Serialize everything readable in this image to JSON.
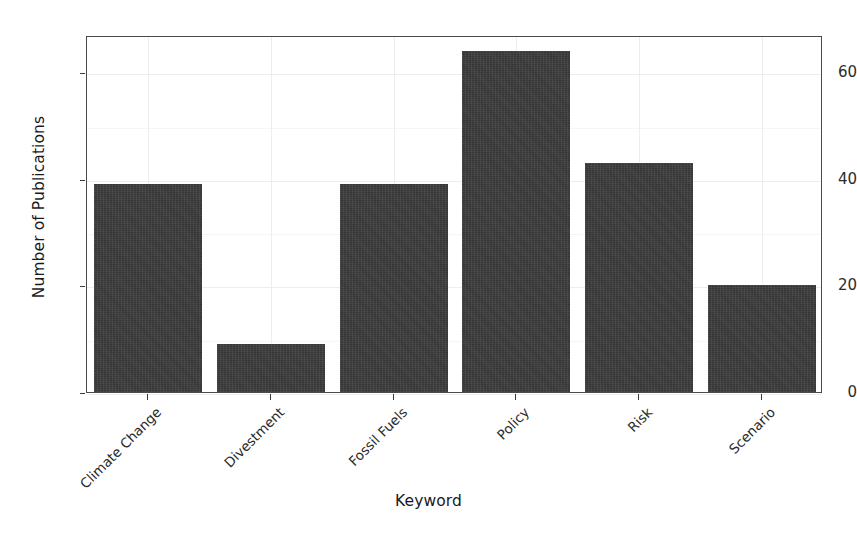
{
  "chart_data": {
    "type": "bar",
    "title": "",
    "xlabel": "Keyword",
    "ylabel": "Number of Publications",
    "categories": [
      "Climate Change",
      "Divestment",
      "Fossil Fuels",
      "Policy",
      "Risk",
      "Scenario"
    ],
    "values": [
      39,
      9,
      39,
      64,
      43,
      20
    ],
    "ylim": [
      0,
      67
    ],
    "yticks": [
      0,
      20,
      40,
      60
    ],
    "ytick_labels": [
      "0",
      "20",
      "40",
      "60"
    ],
    "grid": true,
    "legend": null,
    "bar_color": "#333333",
    "panel_background": "#ffffff",
    "panel_border_color": "#4a4a4a",
    "gridline_color": "#ededed",
    "axis_text_color": "#2b2b2b",
    "xtick_label_rotation_deg": 45
  },
  "figure": {
    "background": "#ffffff",
    "width_px": 857,
    "height_px": 538
  }
}
